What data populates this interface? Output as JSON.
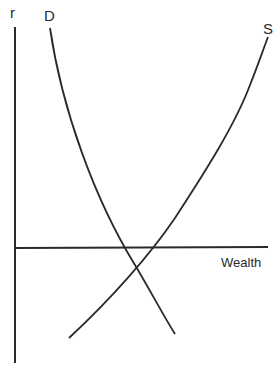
{
  "diagram": {
    "type": "supply-demand",
    "y_axis_label": "r",
    "x_axis_label": "Wealth",
    "curves": [
      {
        "name": "D",
        "label": "D",
        "direction": "downward-sloping"
      },
      {
        "name": "S",
        "label": "S",
        "direction": "upward-sloping"
      }
    ],
    "line_color": "#2a2a2a"
  }
}
